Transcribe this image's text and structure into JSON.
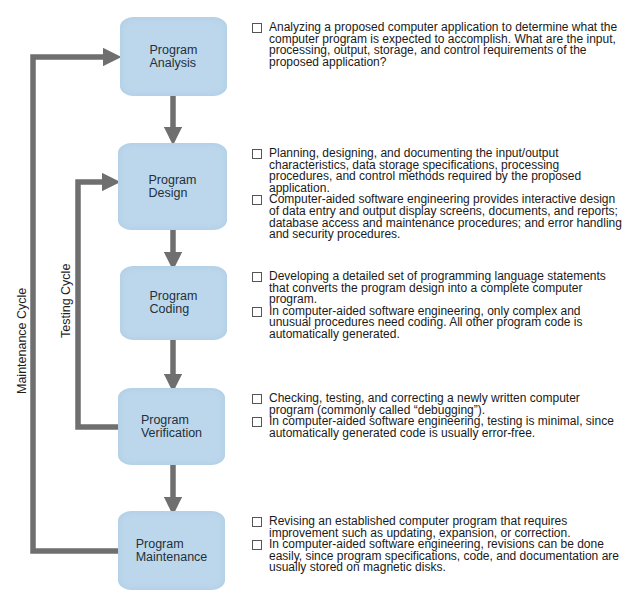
{
  "diagram": {
    "colors": {
      "box_fill": "#bcd7ec",
      "arrow": "#6f6f6f",
      "text": "#1a1a1a"
    },
    "stages": [
      {
        "id": "analysis",
        "label": "Program\nAnalysis",
        "descriptions": [
          "Analyzing a proposed computer application to determine what the computer program is expected to accomplish. What are the input, processing, output, storage, and control requirements of the proposed application?"
        ]
      },
      {
        "id": "design",
        "label": "Program\nDesign",
        "descriptions": [
          "Planning, designing, and documenting the input/output characteristics, data storage specifications, processing procedures, and control methods required by the proposed application.",
          "Computer-aided software engineering provides interactive design of data entry and output display screens, documents, and reports; database access and maintenance procedures; and error handling and security procedures."
        ]
      },
      {
        "id": "coding",
        "label": "Program\nCoding",
        "descriptions": [
          "Developing a detailed set of programming language statements that converts the program design into a complete computer program.",
          "In computer-aided software engineering, only complex and unusual procedures need coding. All other program code is automatically generated."
        ]
      },
      {
        "id": "verification",
        "label": "Program\nVerification",
        "descriptions": [
          "Checking, testing, and correcting a newly written computer program (commonly called “debugging”).",
          "In computer-aided software engineering, testing is minimal, since automatically generated code is usually error-free."
        ]
      },
      {
        "id": "maintenance",
        "label": "Program\nMaintenance",
        "descriptions": [
          "Revising an established computer program that requires improvement such as updating, expansion, or correction.",
          "In computer-aided software engineering, revisions can be done easily, since program specifications, code, and documentation are usually stored on magnetic disks."
        ]
      }
    ],
    "cycles": {
      "maintenance": "Maintenance Cycle",
      "testing": "Testing Cycle"
    }
  }
}
